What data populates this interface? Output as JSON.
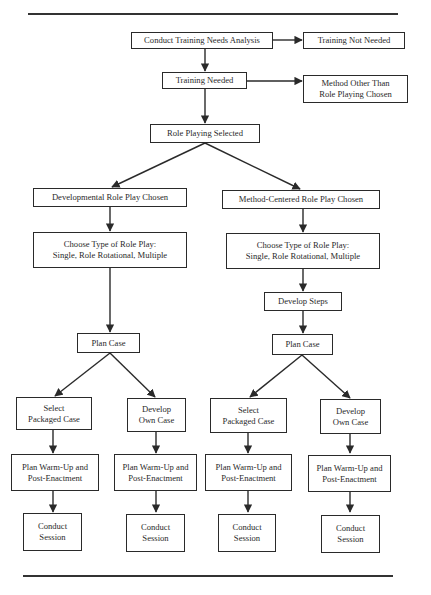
{
  "figure": {
    "nodes": {
      "needs_analysis": "Conduct Training Needs Analysis",
      "not_needed": "Training Not Needed",
      "needed": "Training Needed",
      "other_method": "Method Other Than\nRole Playing Chosen",
      "role_playing": "Role Playing Selected",
      "developmental": "Developmental Role Play Chosen",
      "method_centered": "Method-Centered Role Play Chosen",
      "choose_left": "Choose Type of Role Play:\nSingle, Role Rotational, Multiple",
      "choose_right": "Choose Type of Role Play:\nSingle, Role Rotational, Multiple",
      "develop_steps": "Develop Steps",
      "plan_case_left": "Plan Case",
      "plan_case_right": "Plan Case",
      "select_packaged_1": "Select\nPackaged Case",
      "develop_own_1": "Develop\nOwn Case",
      "select_packaged_2": "Select\nPackaged Case",
      "develop_own_2": "Develop\nOwn Case",
      "warmup_1": "Plan Warm-Up and\nPost-Enactment",
      "warmup_2": "Plan Warm-Up and\nPost-Enactment",
      "warmup_3": "Plan Warm-Up and\nPost-Enactment",
      "warmup_4": "Plan Warm-Up and\nPost-Enactment",
      "session_1": "Conduct\nSession",
      "session_2": "Conduct\nSession",
      "session_3": "Conduct\nSession",
      "session_4": "Conduct\nSession"
    },
    "colors": {
      "line": "#2a2a2a",
      "background": "#ffffff"
    }
  }
}
